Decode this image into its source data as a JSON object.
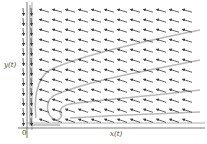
{
  "figure": {
    "type": "phase-portrait",
    "x_axis_label": "x(t)",
    "y_axis_label": "y(t)",
    "origin_label": "0",
    "colors": {
      "arrow": "#3a3a3a",
      "axis": "#555555",
      "trajectory": "#b8b8b8",
      "background": "#ffffff"
    },
    "field": {
      "cols_x": [
        45,
        58,
        71,
        84,
        97,
        110,
        123,
        136,
        149,
        162,
        175,
        188
      ],
      "rows_y": [
        11,
        21,
        31,
        41,
        51,
        61,
        71,
        81,
        91,
        101,
        111,
        121
      ],
      "arrow_direction": "left-down",
      "left_column_x": [
        23,
        31
      ],
      "left_column_direction": "down"
    },
    "trajectories": [
      "M 200 30 C 150 40, 80 55, 50 70 C 36 78, 34 100, 36 118",
      "M 200 60 C 150 70, 90 80, 55 95 C 45 100, 46 112, 52 118 C 58 122, 64 118, 60 110",
      "M 200 90 C 150 96, 100 100, 70 104 C 60 106, 58 112, 62 116",
      "M 200 112 C 150 114, 100 116, 70 118",
      "M 30 5 L 30 125 L 60 125"
    ]
  }
}
